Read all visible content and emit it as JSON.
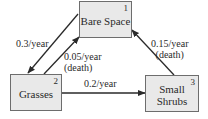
{
  "diagram": {
    "type": "state-transition",
    "nodes": [
      {
        "id": 1,
        "number": "1",
        "label": "Bare Space"
      },
      {
        "id": 2,
        "number": "2",
        "label": "Grasses"
      },
      {
        "id": 3,
        "number": "3",
        "label": "Small\nShrubs"
      }
    ],
    "edges": [
      {
        "from": 1,
        "to": 2,
        "rate": "0.3/year"
      },
      {
        "from": 2,
        "to": 1,
        "rate": "0.05/year\n(death)"
      },
      {
        "from": 2,
        "to": 3,
        "rate": "0.2/year"
      },
      {
        "from": 3,
        "to": 1,
        "rate": "0.15/year\n(death)"
      }
    ]
  },
  "colors": {
    "box_fill": "#e9e9e9",
    "box_border": "#6d6d6d",
    "arrow": "#2a2a2a",
    "text": "#2a2a2a"
  }
}
